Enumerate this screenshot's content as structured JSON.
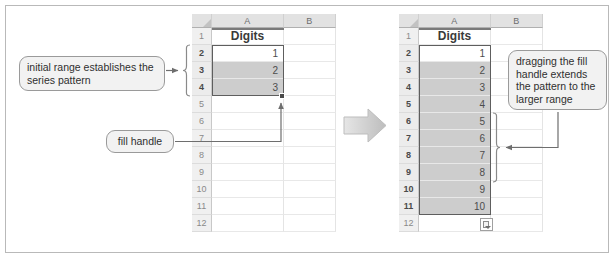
{
  "left_sheet": {
    "columns": [
      "A",
      "B"
    ],
    "column_a_header": "Digits",
    "rows": [
      {
        "row": "1",
        "a": "",
        "selected": false,
        "shaded": false
      },
      {
        "row": "2",
        "a": "1",
        "selected": true,
        "shaded": false
      },
      {
        "row": "3",
        "a": "2",
        "selected": true,
        "shaded": true
      },
      {
        "row": "4",
        "a": "3",
        "selected": true,
        "shaded": true
      },
      {
        "row": "5",
        "a": "",
        "selected": false,
        "shaded": false
      },
      {
        "row": "6",
        "a": "",
        "selected": false,
        "shaded": false
      },
      {
        "row": "7",
        "a": "",
        "selected": false,
        "shaded": false
      },
      {
        "row": "8",
        "a": "",
        "selected": false,
        "shaded": false
      },
      {
        "row": "9",
        "a": "",
        "selected": false,
        "shaded": false
      },
      {
        "row": "10",
        "a": "",
        "selected": false,
        "shaded": false
      },
      {
        "row": "11",
        "a": "",
        "selected": false,
        "shaded": false
      },
      {
        "row": "12",
        "a": "",
        "selected": false,
        "shaded": false
      }
    ]
  },
  "right_sheet": {
    "columns": [
      "A",
      "B"
    ],
    "column_a_header": "Digits",
    "rows": [
      {
        "row": "1",
        "a": "",
        "selected": false,
        "shaded": false
      },
      {
        "row": "2",
        "a": "1",
        "selected": true,
        "shaded": false
      },
      {
        "row": "3",
        "a": "2",
        "selected": true,
        "shaded": true
      },
      {
        "row": "4",
        "a": "3",
        "selected": true,
        "shaded": true
      },
      {
        "row": "5",
        "a": "4",
        "selected": true,
        "shaded": true
      },
      {
        "row": "6",
        "a": "5",
        "selected": true,
        "shaded": true
      },
      {
        "row": "7",
        "a": "6",
        "selected": true,
        "shaded": true
      },
      {
        "row": "8",
        "a": "7",
        "selected": true,
        "shaded": true
      },
      {
        "row": "9",
        "a": "8",
        "selected": true,
        "shaded": true
      },
      {
        "row": "10",
        "a": "9",
        "selected": true,
        "shaded": true
      },
      {
        "row": "11",
        "a": "10",
        "selected": true,
        "shaded": true
      },
      {
        "row": "12",
        "a": "",
        "selected": false,
        "shaded": false
      }
    ]
  },
  "callouts": {
    "initial_range": "initial range establishes the series pattern",
    "fill_handle": "fill handle",
    "dragging": "dragging the fill handle extends the pattern to the larger range"
  },
  "icons": {
    "transition_arrow": "right-arrow-icon",
    "autofill_options": "autofill-options-icon",
    "left_brace": "left-curly-brace",
    "right_brace": "right-curly-brace"
  },
  "colors": {
    "selection_fill": "#cdcdcd",
    "selection_border": "#5e5e5e",
    "header_band": "#e2e2e2",
    "connector": "#6e6e6e",
    "frame_border": "#b9b9b9",
    "arrow_gray": "#c6c6c6"
  }
}
